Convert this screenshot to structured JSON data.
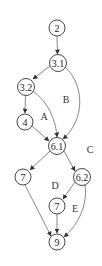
{
  "diagram": {
    "type": "control-flow-graph",
    "nodes": [
      {
        "id": "n2",
        "label": "2",
        "x": 57,
        "y": 28
      },
      {
        "id": "n31",
        "label": "3.1",
        "x": 58,
        "y": 63
      },
      {
        "id": "n32",
        "label": "3.2",
        "x": 26,
        "y": 87
      },
      {
        "id": "n4",
        "label": "4",
        "x": 25,
        "y": 122
      },
      {
        "id": "n61",
        "label": "6.1",
        "x": 57,
        "y": 146
      },
      {
        "id": "n7a",
        "label": "7",
        "x": 23,
        "y": 177
      },
      {
        "id": "n62",
        "label": "6.2",
        "x": 82,
        "y": 177
      },
      {
        "id": "n7b",
        "label": "7",
        "x": 57,
        "y": 206
      },
      {
        "id": "n9",
        "label": "9",
        "x": 57,
        "y": 242
      }
    ],
    "edges": [
      {
        "from": "2",
        "to": "3.1"
      },
      {
        "from": "3.1",
        "to": "3.2"
      },
      {
        "from": "3.1",
        "to": "6.1"
      },
      {
        "from": "3.2",
        "to": "4"
      },
      {
        "from": "3.2",
        "to": "6.1"
      },
      {
        "from": "4",
        "to": "6.1"
      },
      {
        "from": "6.1",
        "to": "7"
      },
      {
        "from": "6.1",
        "to": "6.2"
      },
      {
        "from": "6.2",
        "to": "7"
      },
      {
        "from": "6.2",
        "to": "9"
      },
      {
        "from": "7",
        "to": "9"
      },
      {
        "from": "7 (left)",
        "to": "9"
      }
    ],
    "region_labels": [
      {
        "label": "A",
        "x": 44,
        "y": 116
      },
      {
        "label": "B",
        "x": 66,
        "y": 99
      },
      {
        "label": "C",
        "x": 90,
        "y": 149
      },
      {
        "label": "D",
        "x": 55,
        "y": 185
      },
      {
        "label": "E",
        "x": 75,
        "y": 208
      }
    ]
  }
}
